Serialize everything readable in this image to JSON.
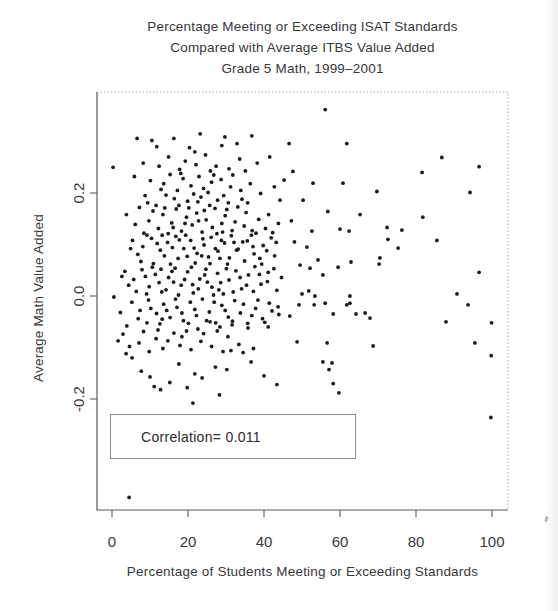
{
  "title": {
    "line1": "Percentage Meeting or Exceeding ISAT Standards",
    "line2": "Compared with Average ITBS Value Added",
    "line3": "Grade 5 Math, 1999–2001"
  },
  "annotation": {
    "label": "Correlation= 0.011"
  },
  "colors": {
    "point": "#1c1c1c",
    "axis": "#5a5a5a",
    "border_dotted": "#a8a8a8",
    "text": "#383838",
    "background": "#ffffff",
    "box_border": "#8a8a8a"
  },
  "chart_data": {
    "type": "scatter",
    "xlabel": "Percentage of Students Meeting or Exceeding Standards",
    "ylabel": "Average Math Value Added",
    "xlim": [
      -4,
      104
    ],
    "ylim": [
      -0.415,
      0.396
    ],
    "x_ticks": [
      0,
      20,
      40,
      60,
      80,
      100
    ],
    "x_tick_labels": [
      "0",
      "20",
      "40",
      "60",
      "80",
      "100"
    ],
    "y_ticks": [
      0.2,
      0.0,
      -0.2
    ],
    "y_tick_labels": [
      "0.2",
      "0.0",
      "-0.2"
    ],
    "grid": false,
    "legend": "none",
    "annotation_text": "Correlation= 0.011",
    "correlation": 0.011,
    "points": [
      [
        23.2,
        0.315
      ],
      [
        6.6,
        0.306
      ],
      [
        10.5,
        0.302
      ],
      [
        16.3,
        0.306
      ],
      [
        29.7,
        0.309
      ],
      [
        36.8,
        0.311
      ],
      [
        32.9,
        0.296
      ],
      [
        11.8,
        0.29
      ],
      [
        21.8,
        0.28
      ],
      [
        28.9,
        0.292
      ],
      [
        0.3,
        0.25
      ],
      [
        14.9,
        0.27
      ],
      [
        19.3,
        0.262
      ],
      [
        24.6,
        0.274
      ],
      [
        8.2,
        0.258
      ],
      [
        27.4,
        0.252
      ],
      [
        33.6,
        0.266
      ],
      [
        17.8,
        0.246
      ],
      [
        22.1,
        0.255
      ],
      [
        30.8,
        0.247
      ],
      [
        12.4,
        0.252
      ],
      [
        25.9,
        0.243
      ],
      [
        38.2,
        0.258
      ],
      [
        41.5,
        0.27
      ],
      [
        20.4,
        0.288
      ],
      [
        35.1,
        0.243
      ],
      [
        15.3,
        0.236
      ],
      [
        18.7,
        0.228
      ],
      [
        22.9,
        0.232
      ],
      [
        26.2,
        0.221
      ],
      [
        10.1,
        0.224
      ],
      [
        13.6,
        0.218
      ],
      [
        20.8,
        0.214
      ],
      [
        24.1,
        0.209
      ],
      [
        28.7,
        0.226
      ],
      [
        31.2,
        0.212
      ],
      [
        17.2,
        0.205
      ],
      [
        21.5,
        0.198
      ],
      [
        25.3,
        0.201
      ],
      [
        29.4,
        0.195
      ],
      [
        33.9,
        0.205
      ],
      [
        36.4,
        0.218
      ],
      [
        8.7,
        0.195
      ],
      [
        12.9,
        0.207
      ],
      [
        16.4,
        0.189
      ],
      [
        19.9,
        0.184
      ],
      [
        23.4,
        0.192
      ],
      [
        27.8,
        0.186
      ],
      [
        30.6,
        0.181
      ],
      [
        34.2,
        0.188
      ],
      [
        39.1,
        0.199
      ],
      [
        42.7,
        0.212
      ],
      [
        5.9,
        0.232
      ],
      [
        9.4,
        0.181
      ],
      [
        14.2,
        0.196
      ],
      [
        18.1,
        0.238
      ],
      [
        22.6,
        0.183
      ],
      [
        26.8,
        0.235
      ],
      [
        31.8,
        0.235
      ],
      [
        35.7,
        0.181
      ],
      [
        44.2,
        0.186
      ],
      [
        7.2,
        0.172
      ],
      [
        10.8,
        0.165
      ],
      [
        13.4,
        0.158
      ],
      [
        16.9,
        0.169
      ],
      [
        19.6,
        0.153
      ],
      [
        22.3,
        0.161
      ],
      [
        24.8,
        0.148
      ],
      [
        27.1,
        0.17
      ],
      [
        29.8,
        0.156
      ],
      [
        32.4,
        0.144
      ],
      [
        35.3,
        0.162
      ],
      [
        38.6,
        0.149
      ],
      [
        41.2,
        0.158
      ],
      [
        6.1,
        0.139
      ],
      [
        9.7,
        0.146
      ],
      [
        12.2,
        0.131
      ],
      [
        15.7,
        0.142
      ],
      [
        18.3,
        0.126
      ],
      [
        21.1,
        0.138
      ],
      [
        23.7,
        0.124
      ],
      [
        26.4,
        0.133
      ],
      [
        28.9,
        0.141
      ],
      [
        31.6,
        0.127
      ],
      [
        34.8,
        0.136
      ],
      [
        37.9,
        0.122
      ],
      [
        40.4,
        0.131
      ],
      [
        43.8,
        0.141
      ],
      [
        8.4,
        0.122
      ],
      [
        11.6,
        0.176
      ],
      [
        14.8,
        0.121
      ],
      [
        17.6,
        0.176
      ],
      [
        20.2,
        0.171
      ],
      [
        25.7,
        0.176
      ],
      [
        30.2,
        0.168
      ],
      [
        33.1,
        0.173
      ],
      [
        36.9,
        0.127
      ],
      [
        3.8,
        0.158
      ],
      [
        42.3,
        0.123
      ],
      [
        16.1,
        0.133
      ],
      [
        22.8,
        0.146
      ],
      [
        27.6,
        0.121
      ],
      [
        13.9,
        0.171
      ],
      [
        19.2,
        0.141
      ],
      [
        24.3,
        0.166
      ],
      [
        29.1,
        0.124
      ],
      [
        5.4,
        0.108
      ],
      [
        8.1,
        0.096
      ],
      [
        10.4,
        0.112
      ],
      [
        12.7,
        0.089
      ],
      [
        14.6,
        0.104
      ],
      [
        16.8,
        0.116
      ],
      [
        18.9,
        0.092
      ],
      [
        20.7,
        0.108
      ],
      [
        22.4,
        0.083
      ],
      [
        24.2,
        0.099
      ],
      [
        26.1,
        0.114
      ],
      [
        27.9,
        0.087
      ],
      [
        29.6,
        0.103
      ],
      [
        31.4,
        0.117
      ],
      [
        33.2,
        0.091
      ],
      [
        35.6,
        0.107
      ],
      [
        37.4,
        0.082
      ],
      [
        39.8,
        0.098
      ],
      [
        41.9,
        0.113
      ],
      [
        6.8,
        0.081
      ],
      [
        9.2,
        0.118
      ],
      [
        11.9,
        0.102
      ],
      [
        13.8,
        0.078
      ],
      [
        15.9,
        0.094
      ],
      [
        17.7,
        0.109
      ],
      [
        19.8,
        0.077
      ],
      [
        21.6,
        0.093
      ],
      [
        23.9,
        0.111
      ],
      [
        25.4,
        0.076
      ],
      [
        27.2,
        0.092
      ],
      [
        28.8,
        0.108
      ],
      [
        30.9,
        0.074
      ],
      [
        32.8,
        0.089
      ],
      [
        34.4,
        0.105
      ],
      [
        36.7,
        0.118
      ],
      [
        38.9,
        0.073
      ],
      [
        40.7,
        0.088
      ],
      [
        43.2,
        0.104
      ],
      [
        4.9,
        0.092
      ],
      [
        7.6,
        0.067
      ],
      [
        10.9,
        0.063
      ],
      [
        13.2,
        0.118
      ],
      [
        15.4,
        0.062
      ],
      [
        17.4,
        0.073
      ],
      [
        19.4,
        0.118
      ],
      [
        21.9,
        0.064
      ],
      [
        23.6,
        0.078
      ],
      [
        25.8,
        0.063
      ],
      [
        28.4,
        0.073
      ],
      [
        30.4,
        0.062
      ],
      [
        32.1,
        0.104
      ],
      [
        34.9,
        0.068
      ],
      [
        37.1,
        0.096
      ],
      [
        39.4,
        0.062
      ],
      [
        42.8,
        0.078
      ],
      [
        3.4,
        0.048
      ],
      [
        5.7,
        0.032
      ],
      [
        7.9,
        0.051
      ],
      [
        9.8,
        0.018
      ],
      [
        11.4,
        0.042
      ],
      [
        13.1,
        0.008
      ],
      [
        14.9,
        0.036
      ],
      [
        16.6,
        0.054
      ],
      [
        18.2,
        0.021
      ],
      [
        19.9,
        0.047
      ],
      [
        21.4,
        0.006
      ],
      [
        23.1,
        0.033
      ],
      [
        24.7,
        0.052
      ],
      [
        26.3,
        0.017
      ],
      [
        27.8,
        0.044
      ],
      [
        29.3,
        0.004
      ],
      [
        30.8,
        0.031
      ],
      [
        32.6,
        0.049
      ],
      [
        34.1,
        0.014
      ],
      [
        35.9,
        0.041
      ],
      [
        37.6,
        0.057
      ],
      [
        39.2,
        0.023
      ],
      [
        41.1,
        0.046
      ],
      [
        43.4,
        0.011
      ],
      [
        6.4,
        0.009
      ],
      [
        8.8,
        0.038
      ],
      [
        10.6,
        0.056
      ],
      [
        12.4,
        0.026
      ],
      [
        14.2,
        0.012
      ],
      [
        15.8,
        0.048
      ],
      [
        17.5,
        0.002
      ],
      [
        19.1,
        0.032
      ],
      [
        20.9,
        0.056
      ],
      [
        22.7,
        0.014
      ],
      [
        24.4,
        0.041
      ],
      [
        26.7,
        0.002
      ],
      [
        28.6,
        0.026
      ],
      [
        30.1,
        0.053
      ],
      [
        31.9,
        0.008
      ],
      [
        33.7,
        0.036
      ],
      [
        35.4,
        0.021
      ],
      [
        37.2,
        0.009
      ],
      [
        38.8,
        0.042
      ],
      [
        40.9,
        0.028
      ],
      [
        42.6,
        0.053
      ],
      [
        4.4,
        0.021
      ],
      [
        2.6,
        0.038
      ],
      [
        44.6,
        0.036
      ],
      [
        16.2,
        0.027
      ],
      [
        21.2,
        0.022
      ],
      [
        25.1,
        0.027
      ],
      [
        28.1,
        0.012
      ],
      [
        12.9,
        0.052
      ],
      [
        9.1,
        0.004
      ],
      [
        0.5,
        -0.002
      ],
      [
        3.9,
        -0.058
      ],
      [
        9.2,
        -0.052
      ],
      [
        13.2,
        -0.045
      ],
      [
        5.2,
        -0.012
      ],
      [
        7.4,
        -0.028
      ],
      [
        9.6,
        -0.008
      ],
      [
        11.7,
        -0.034
      ],
      [
        13.6,
        -0.016
      ],
      [
        15.3,
        -0.042
      ],
      [
        17.1,
        -0.022
      ],
      [
        18.8,
        -0.048
      ],
      [
        20.6,
        -0.012
      ],
      [
        22.2,
        -0.038
      ],
      [
        23.8,
        -0.006
      ],
      [
        25.6,
        -0.031
      ],
      [
        27.3,
        -0.052
      ],
      [
        28.9,
        -0.018
      ],
      [
        30.6,
        -0.041
      ],
      [
        32.3,
        -0.009
      ],
      [
        33.8,
        -0.033
      ],
      [
        35.7,
        -0.053
      ],
      [
        37.8,
        -0.024
      ],
      [
        39.6,
        -0.044
      ],
      [
        41.4,
        -0.014
      ],
      [
        43.9,
        -0.036
      ],
      [
        6.9,
        -0.044
      ],
      [
        10.2,
        -0.024
      ],
      [
        12.6,
        -0.054
      ],
      [
        14.4,
        -0.028
      ],
      [
        16.7,
        -0.006
      ],
      [
        18.4,
        -0.033
      ],
      [
        20.1,
        -0.053
      ],
      [
        21.8,
        -0.026
      ],
      [
        24.9,
        -0.048
      ],
      [
        26.9,
        -0.012
      ],
      [
        29.8,
        -0.028
      ],
      [
        31.7,
        -0.049
      ],
      [
        34.6,
        -0.016
      ],
      [
        36.8,
        -0.038
      ],
      [
        38.4,
        -0.008
      ],
      [
        40.2,
        -0.051
      ],
      [
        42.1,
        -0.029
      ],
      [
        2.2,
        -0.032
      ],
      [
        25.8,
        -0.05
      ],
      [
        22.6,
        -0.064
      ],
      [
        28.4,
        -0.06
      ],
      [
        31.6,
        -0.056
      ],
      [
        35.8,
        -0.062
      ],
      [
        41.1,
        -0.06
      ],
      [
        1.6,
        -0.087
      ],
      [
        7.1,
        -0.091
      ],
      [
        11.6,
        -0.083
      ],
      [
        14.7,
        -0.087
      ],
      [
        16.3,
        -0.072
      ],
      [
        18.4,
        -0.079
      ],
      [
        30.5,
        -0.079
      ],
      [
        4.6,
        -0.098
      ],
      [
        9.8,
        -0.108
      ],
      [
        13.4,
        -0.102
      ],
      [
        17.9,
        -0.096
      ],
      [
        20.8,
        -0.104
      ],
      [
        23.4,
        -0.088
      ],
      [
        26.2,
        -0.098
      ],
      [
        29.2,
        -0.108
      ],
      [
        33.4,
        -0.094
      ],
      [
        37.2,
        -0.102
      ],
      [
        8.3,
        -0.069
      ],
      [
        12.1,
        -0.066
      ],
      [
        19.6,
        -0.068
      ],
      [
        24.1,
        -0.073
      ],
      [
        27.7,
        -0.068
      ],
      [
        2.9,
        -0.074
      ],
      [
        3.7,
        -0.112
      ],
      [
        31.3,
        -0.106
      ],
      [
        34.5,
        -0.11
      ],
      [
        5.3,
        -0.12
      ],
      [
        10.0,
        -0.157
      ],
      [
        11.1,
        -0.176
      ],
      [
        21.8,
        -0.151
      ],
      [
        23.7,
        -0.159
      ],
      [
        40.0,
        -0.155
      ],
      [
        17.6,
        -0.132
      ],
      [
        7.7,
        -0.146
      ],
      [
        27.2,
        -0.138
      ],
      [
        15.2,
        -0.168
      ],
      [
        36.6,
        -0.128
      ],
      [
        19.8,
        -0.178
      ],
      [
        30.2,
        -0.143
      ],
      [
        12.8,
        -0.182
      ],
      [
        28.3,
        -0.192
      ],
      [
        21.3,
        -0.208
      ],
      [
        45.3,
        0.225
      ],
      [
        46.6,
        0.296
      ],
      [
        61.8,
        0.296
      ],
      [
        60.8,
        0.219
      ],
      [
        52.9,
        0.219
      ],
      [
        50.3,
        0.186
      ],
      [
        56.8,
        0.164
      ],
      [
        69.7,
        0.203
      ],
      [
        72.4,
        0.133
      ],
      [
        52.6,
        0.126
      ],
      [
        60.0,
        0.13
      ],
      [
        62.4,
        0.126
      ],
      [
        76.3,
        0.128
      ],
      [
        51.3,
        0.095
      ],
      [
        72.6,
        0.11
      ],
      [
        75.3,
        0.093
      ],
      [
        70.5,
        0.074
      ],
      [
        49.5,
        0.06
      ],
      [
        52.1,
        0.054
      ],
      [
        54.2,
        0.07
      ],
      [
        59.5,
        0.056
      ],
      [
        62.9,
        0.066
      ],
      [
        55.5,
        0.041
      ],
      [
        70.3,
        0.062
      ],
      [
        50.0,
        0.004
      ],
      [
        53.4,
        0.0
      ],
      [
        51.8,
        0.01
      ],
      [
        62.6,
        0.0
      ],
      [
        62.6,
        -0.014
      ],
      [
        53.2,
        -0.017
      ],
      [
        56.1,
        -0.014
      ],
      [
        58.2,
        -0.035
      ],
      [
        61.8,
        -0.017
      ],
      [
        64.2,
        -0.035
      ],
      [
        66.6,
        -0.033
      ],
      [
        67.9,
        -0.043
      ],
      [
        56.6,
        -0.091
      ],
      [
        68.7,
        -0.097
      ],
      [
        55.5,
        -0.128
      ],
      [
        57.9,
        -0.13
      ],
      [
        57.1,
        -0.143
      ],
      [
        58.2,
        -0.17
      ],
      [
        59.7,
        -0.188
      ],
      [
        46.8,
        -0.039
      ],
      [
        48.7,
        -0.089
      ],
      [
        43.7,
        -0.021
      ],
      [
        49.2,
        -0.017
      ],
      [
        43.4,
        -0.172
      ],
      [
        47.2,
        0.146
      ],
      [
        48.0,
        0.105
      ],
      [
        65.3,
        0.158
      ],
      [
        47.6,
        0.242
      ],
      [
        56.1,
        0.362
      ],
      [
        86.8,
        0.269
      ],
      [
        81.6,
        0.24
      ],
      [
        96.6,
        0.251
      ],
      [
        94.2,
        0.201
      ],
      [
        81.8,
        0.153
      ],
      [
        85.5,
        0.108
      ],
      [
        96.6,
        0.046
      ],
      [
        90.8,
        0.004
      ],
      [
        93.7,
        -0.017
      ],
      [
        87.9,
        -0.05
      ],
      [
        99.9,
        -0.052
      ],
      [
        95.5,
        -0.091
      ],
      [
        99.8,
        -0.116
      ],
      [
        99.7,
        -0.236
      ],
      [
        4.5,
        -0.391
      ]
    ]
  }
}
